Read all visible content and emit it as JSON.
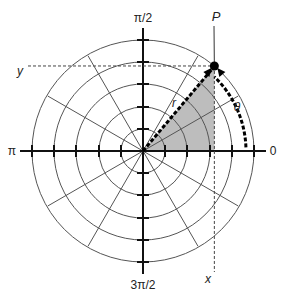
{
  "diagram": {
    "center": {
      "x": 143,
      "y": 151
    },
    "ring_radii": [
      22,
      44,
      67,
      89,
      111
    ],
    "tick_length": 6,
    "spoke_angles_deg": [
      30,
      60,
      120,
      150,
      210,
      240,
      300,
      330
    ],
    "spoke_inner": 0,
    "spoke_outer": 98,
    "axis_half_length": 123,
    "point": {
      "label": "P",
      "r": 111,
      "theta_deg": 50
    },
    "shade_color": "#bdbdbd",
    "line_color": "#555555",
    "axis_color": "#111111",
    "labels": {
      "angle_top": "π/2",
      "angle_left": "π",
      "angle_right": "0",
      "angle_bottom": "3π/2",
      "point": "P",
      "radius": "r",
      "theta": "θ",
      "x": "x",
      "y": "y"
    }
  }
}
